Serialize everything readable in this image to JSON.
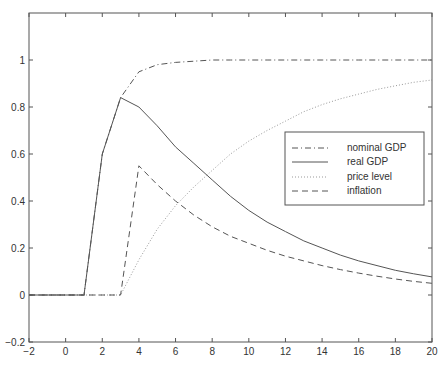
{
  "chart_data": {
    "type": "line",
    "title": "",
    "xlabel": "",
    "ylabel": "",
    "xlim": [
      -2,
      20
    ],
    "ylim": [
      -0.2,
      1.2
    ],
    "grid": false,
    "legend_position": "right-middle (inside plot)",
    "x_ticks": [
      -2,
      0,
      2,
      4,
      6,
      8,
      10,
      12,
      14,
      16,
      18,
      20
    ],
    "x_tick_labels": [
      "−2",
      "0",
      "2",
      "4",
      "6",
      "8",
      "10",
      "12",
      "14",
      "16",
      "18",
      "20"
    ],
    "y_ticks": [
      -0.2,
      0,
      0.2,
      0.4,
      0.6,
      0.8,
      1
    ],
    "y_tick_labels": [
      "−0.2",
      "0",
      "0.2",
      "0.4",
      "0.6",
      "0.8",
      "1"
    ],
    "x": [
      -2,
      -1,
      0,
      1,
      2,
      3,
      4,
      5,
      6,
      7,
      8,
      9,
      10,
      11,
      12,
      13,
      14,
      15,
      16,
      17,
      18,
      19,
      20
    ],
    "series": [
      {
        "name": "nominal GDP",
        "style": "dashdot",
        "values": [
          0,
          0,
          0,
          0,
          0.6,
          0.84,
          0.95,
          0.98,
          0.99,
          0.995,
          1.0,
          1.0,
          1.0,
          1.0,
          1.0,
          1.0,
          1.0,
          1.0,
          1.0,
          1.0,
          1.0,
          1.0,
          1.0
        ]
      },
      {
        "name": "real GDP",
        "style": "solid",
        "values": [
          0,
          0,
          0,
          0,
          0.6,
          0.84,
          0.8,
          0.72,
          0.63,
          0.56,
          0.49,
          0.42,
          0.36,
          0.31,
          0.27,
          0.23,
          0.2,
          0.17,
          0.145,
          0.125,
          0.105,
          0.09,
          0.077
        ]
      },
      {
        "name": "price level",
        "style": "dotted",
        "values": [
          0,
          0,
          0,
          0,
          0,
          0,
          0.15,
          0.28,
          0.38,
          0.46,
          0.53,
          0.6,
          0.655,
          0.7,
          0.74,
          0.78,
          0.81,
          0.835,
          0.855,
          0.875,
          0.89,
          0.905,
          0.915
        ]
      },
      {
        "name": "inflation",
        "style": "dashed",
        "values": [
          0,
          0,
          0,
          0,
          0,
          0,
          0.55,
          0.47,
          0.4,
          0.34,
          0.29,
          0.25,
          0.22,
          0.19,
          0.165,
          0.145,
          0.125,
          0.108,
          0.093,
          0.08,
          0.068,
          0.058,
          0.05
        ]
      }
    ]
  },
  "legend": {
    "items": [
      "nominal GDP",
      "real GDP",
      "price level",
      "inflation"
    ]
  },
  "colors": {
    "axis": "#555555",
    "line": "#555555",
    "text": "#333333"
  }
}
